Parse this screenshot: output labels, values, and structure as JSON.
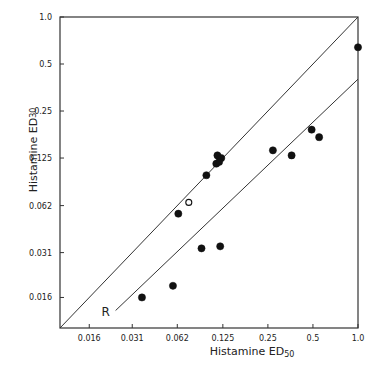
{
  "chart_data": {
    "type": "scatter",
    "title": "",
    "xlabel": "Histamine ED50",
    "xlabel_main": "Histamine ED",
    "xlabel_sub": "50",
    "ylabel": "Histamine ED30",
    "ylabel_main": "Histamine ED",
    "ylabel_sub": "30",
    "xscale": "log2",
    "yscale": "log2",
    "xlim": [
      0.0102,
      1.0
    ],
    "ylim": [
      0.0102,
      1.0
    ],
    "x_ticks": [
      {
        "value": 0.016,
        "label": "0.016"
      },
      {
        "value": 0.031,
        "label": "0.031"
      },
      {
        "value": 0.062,
        "label": "0.062"
      },
      {
        "value": 0.125,
        "label": "0.125"
      },
      {
        "value": 0.25,
        "label": "0.25"
      },
      {
        "value": 0.5,
        "label": "0.5"
      },
      {
        "value": 1.0,
        "label": "1.0"
      }
    ],
    "y_ticks": [
      {
        "value": 0.016,
        "label": "0.016"
      },
      {
        "value": 0.031,
        "label": "0.031"
      },
      {
        "value": 0.062,
        "label": "0.062"
      },
      {
        "value": 0.125,
        "label": "0.125"
      },
      {
        "value": 0.25,
        "label": "0.25"
      },
      {
        "value": 0.5,
        "label": "0.5"
      },
      {
        "value": 1.0,
        "label": "1.0"
      }
    ],
    "grid": false,
    "legend": null,
    "lines": [
      {
        "name": "identity",
        "label": "",
        "from": [
          0.0102,
          0.0102
        ],
        "to": [
          1.0,
          1.0
        ]
      },
      {
        "name": "regression",
        "label": "R",
        "from": [
          0.024,
          0.0132
        ],
        "to": [
          1.0,
          0.4
        ]
      }
    ],
    "series": [
      {
        "name": "filled",
        "marker": "filled-circle",
        "points": [
          {
            "x": 1.0,
            "y": 0.64
          },
          {
            "x": 0.49,
            "y": 0.19
          },
          {
            "x": 0.55,
            "y": 0.17
          },
          {
            "x": 0.27,
            "y": 0.14
          },
          {
            "x": 0.36,
            "y": 0.13
          },
          {
            "x": 0.115,
            "y": 0.13
          },
          {
            "x": 0.122,
            "y": 0.125
          },
          {
            "x": 0.113,
            "y": 0.115
          },
          {
            "x": 0.118,
            "y": 0.118
          },
          {
            "x": 0.097,
            "y": 0.097
          },
          {
            "x": 0.063,
            "y": 0.055
          },
          {
            "x": 0.09,
            "y": 0.033
          },
          {
            "x": 0.12,
            "y": 0.034
          },
          {
            "x": 0.058,
            "y": 0.019
          },
          {
            "x": 0.036,
            "y": 0.016
          }
        ]
      },
      {
        "name": "open",
        "marker": "open-circle",
        "points": [
          {
            "x": 0.074,
            "y": 0.065
          }
        ]
      }
    ]
  }
}
